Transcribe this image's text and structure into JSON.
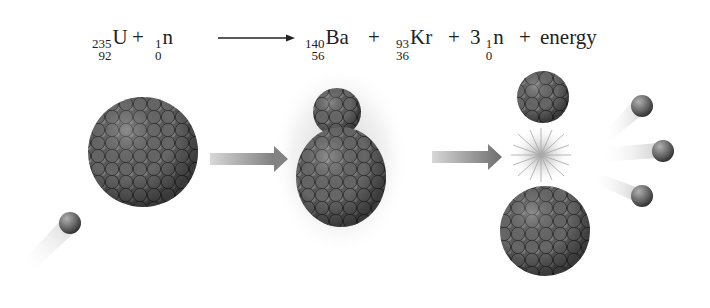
{
  "equation": {
    "reactants": [
      {
        "mass": "235",
        "atomic": "92",
        "symbol": "U"
      },
      {
        "mass": "1",
        "atomic": "0",
        "symbol": "n"
      }
    ],
    "products": [
      {
        "mass": "140",
        "atomic": "56",
        "symbol": "Ba"
      },
      {
        "mass": "93",
        "atomic": "36",
        "symbol": "Kr"
      },
      {
        "coefficient": "3",
        "mass": "1",
        "atomic": "0",
        "symbol": "n"
      }
    ],
    "plus": "+",
    "energy": "energy",
    "arrow_icon": "long-right-arrow"
  },
  "diagram": {
    "stages": [
      {
        "name": "uranium-235 nucleus with incoming neutron"
      },
      {
        "name": "unstable compound nucleus"
      },
      {
        "name": "fission products: Kr, Ba, 3 neutrons, energy flash"
      }
    ],
    "colors": {
      "nucleon_dark": "#3c3c3c",
      "nucleon_mid": "#6e6e6e",
      "nucleon_light": "#a8a8a8",
      "arrow": "#7a7a7a",
      "text": "#222222"
    }
  }
}
